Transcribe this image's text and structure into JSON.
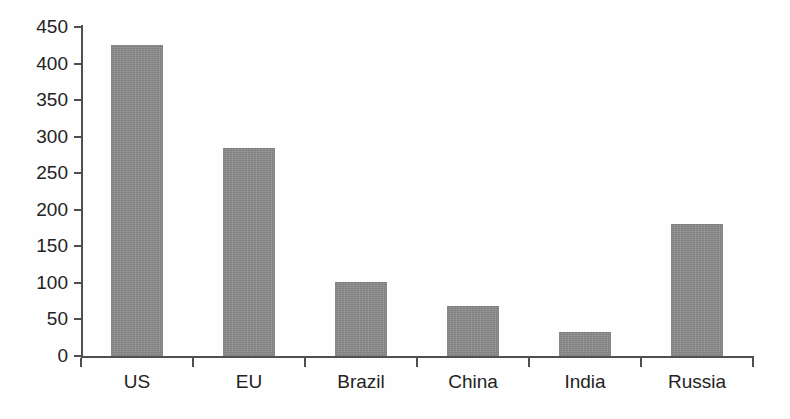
{
  "chart_data": {
    "type": "bar",
    "title": "",
    "subtitle": "",
    "xlabel": "",
    "ylabel": "",
    "categories": [
      "US",
      "EU",
      "Brazil",
      "China",
      "India",
      "Russia"
    ],
    "values": [
      425,
      285,
      101,
      68,
      33,
      181
    ],
    "series": [
      {
        "name": "",
        "values": [
          425,
          285,
          101,
          68,
          33,
          181
        ]
      }
    ],
    "ylim": [
      0,
      450
    ],
    "yticks": [
      0,
      50,
      100,
      150,
      200,
      250,
      300,
      350,
      400,
      450
    ],
    "ytick_labels": [
      "0",
      "50",
      "100",
      "150",
      "200",
      "250",
      "300",
      "350",
      "400",
      "450"
    ],
    "grid": false,
    "legend": null,
    "legend_position": "none",
    "annotations": [],
    "bar_color": "#8b8b8b",
    "axis_color": "#4f4f4f",
    "background_color": "#fefefe",
    "text_color": "#232323"
  }
}
